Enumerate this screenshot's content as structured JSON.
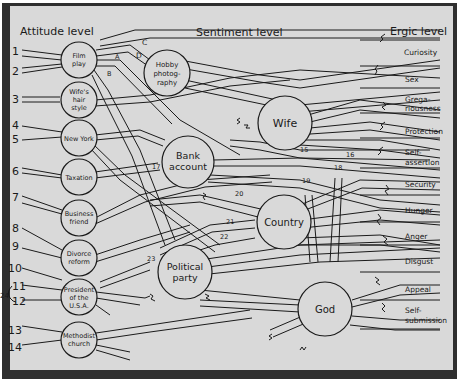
{
  "headers": {
    "attitude": "Attitude level",
    "sentiment": "Sentiment level",
    "ergic": "Ergic level"
  },
  "attitudes": [
    {
      "id": "film",
      "lines": [
        "Film",
        "play"
      ],
      "nums": [
        "1",
        "2"
      ]
    },
    {
      "id": "wife-hair",
      "lines": [
        "Wife's",
        "hair",
        "style"
      ],
      "nums": [
        "3"
      ]
    },
    {
      "id": "new-york",
      "lines": [
        "New York"
      ],
      "nums": [
        "4",
        "5"
      ]
    },
    {
      "id": "taxation",
      "lines": [
        "Taxation"
      ],
      "nums": [
        "6"
      ]
    },
    {
      "id": "business-friend",
      "lines": [
        "Business",
        "friend"
      ],
      "nums": [
        "7"
      ]
    },
    {
      "id": "divorce-reform",
      "lines": [
        "Divorce",
        "reform"
      ],
      "nums": [
        "8",
        "9"
      ]
    },
    {
      "id": "president",
      "lines": [
        "President",
        "of the",
        "U.S.A."
      ],
      "nums": [
        "10",
        "11",
        "12",
        "24"
      ]
    },
    {
      "id": "methodist",
      "lines": [
        "Methodist",
        "church"
      ],
      "nums": [
        "13",
        "14"
      ]
    }
  ],
  "sentiments": [
    {
      "id": "hobby",
      "lines": [
        "Hobby",
        "photog-",
        "raphy"
      ]
    },
    {
      "id": "wife",
      "lines": [
        "Wife"
      ]
    },
    {
      "id": "bank",
      "lines": [
        "Bank",
        "account"
      ]
    },
    {
      "id": "country",
      "lines": [
        "Country"
      ]
    },
    {
      "id": "political",
      "lines": [
        "Political",
        "party"
      ]
    },
    {
      "id": "god",
      "lines": [
        "God"
      ]
    }
  ],
  "ergs": [
    {
      "id": "curiosity",
      "lines": [
        "Curiosity"
      ]
    },
    {
      "id": "sex",
      "lines": [
        "Sex"
      ]
    },
    {
      "id": "gregariousness",
      "lines": [
        "Grega-",
        "riousness"
      ]
    },
    {
      "id": "protection",
      "lines": [
        "Protection"
      ]
    },
    {
      "id": "self-assertion",
      "lines": [
        "Self-",
        "assertion"
      ]
    },
    {
      "id": "security",
      "lines": [
        "Security"
      ]
    },
    {
      "id": "hunger",
      "lines": [
        "Hunger"
      ]
    },
    {
      "id": "anger",
      "lines": [
        "Anger"
      ]
    },
    {
      "id": "disgust",
      "lines": [
        "Disgust"
      ]
    },
    {
      "id": "appeal",
      "lines": [
        "Appeal"
      ]
    },
    {
      "id": "self-submission",
      "lines": [
        "Self-",
        "submission"
      ]
    }
  ],
  "path_labels": {
    "a": "A",
    "b": "B",
    "c": "C",
    "d": "D",
    "n15": "15",
    "n16": "16",
    "n17": "17",
    "n18": "18",
    "n19": "19",
    "n20": "20",
    "n21": "21",
    "n22": "22",
    "n23": "23"
  },
  "colors": {
    "frame": "#2f2f2f",
    "panel": "#d9d9d9",
    "ink": "#1a1a1a"
  }
}
